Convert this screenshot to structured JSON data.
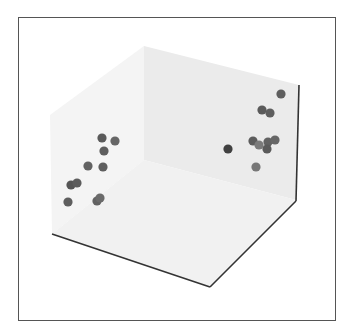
{
  "chart_data": {
    "type": "scatter",
    "projection": "3d",
    "title": "",
    "xlabel": "",
    "ylabel": "",
    "zlabel": "",
    "grid": false,
    "ticks_visible": false,
    "legend": null,
    "marker_color": "#555555",
    "pane_colors": {
      "left_wall": "#f4f4f4",
      "back_wall": "#ebebeb",
      "floor": "#f1f1f1"
    },
    "axis_line_color": "#333333",
    "note": "No tick labels are visible; points are given as projected screen coordinates (px) grouped in two clusters.",
    "series": [
      {
        "name": "cluster-left",
        "points": [
          {
            "px": 102,
            "py": 138,
            "shade": "#5a5a5a"
          },
          {
            "px": 115,
            "py": 141,
            "shade": "#666666"
          },
          {
            "px": 104,
            "py": 151,
            "shade": "#5e5e5e"
          },
          {
            "px": 88,
            "py": 166,
            "shade": "#626262"
          },
          {
            "px": 103,
            "py": 167,
            "shade": "#5e5e5e"
          },
          {
            "px": 71,
            "py": 185,
            "shade": "#555555"
          },
          {
            "px": 77,
            "py": 183,
            "shade": "#5c5c5c"
          },
          {
            "px": 68,
            "py": 202,
            "shade": "#5e5e5e"
          },
          {
            "px": 97,
            "py": 201,
            "shade": "#626262"
          },
          {
            "px": 100,
            "py": 198,
            "shade": "#6a6a6a"
          }
        ]
      },
      {
        "name": "cluster-right",
        "points": [
          {
            "px": 281,
            "py": 94,
            "shade": "#5e5e5e"
          },
          {
            "px": 262,
            "py": 110,
            "shade": "#5a5a5a"
          },
          {
            "px": 270,
            "py": 113,
            "shade": "#5e5e5e"
          },
          {
            "px": 228,
            "py": 149,
            "shade": "#404040"
          },
          {
            "px": 253,
            "py": 141,
            "shade": "#5c5c5c"
          },
          {
            "px": 259,
            "py": 145,
            "shade": "#7a7a7a"
          },
          {
            "px": 268,
            "py": 142,
            "shade": "#626262"
          },
          {
            "px": 275,
            "py": 140,
            "shade": "#666666"
          },
          {
            "px": 267,
            "py": 149,
            "shade": "#5a5a5a"
          },
          {
            "px": 256,
            "py": 167,
            "shade": "#777777"
          }
        ]
      }
    ]
  }
}
